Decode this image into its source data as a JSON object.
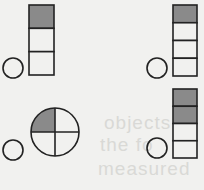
{
  "colors": {
    "background": "#f1f1ef",
    "stroke": "#222222",
    "shaded": "#8a8a8a",
    "unshaded": "#f1f1ef"
  },
  "bleed_through_text": [
    "objects",
    "the fo",
    "measured"
  ],
  "panels": [
    {
      "id": "top-left",
      "type": "bar",
      "parts": 3,
      "shaded": 1,
      "fraction": "1/3",
      "small_circle": {
        "cx": 13,
        "cy": 68,
        "r": 10
      },
      "shape": {
        "x": 29,
        "y": 5,
        "w": 25,
        "h": 70
      }
    },
    {
      "id": "top-right",
      "type": "bar",
      "parts": 4,
      "shaded": 1,
      "fraction": "1/4",
      "small_circle": {
        "cx": 157,
        "cy": 68,
        "r": 10
      },
      "shape": {
        "x": 173,
        "y": 5,
        "w": 24,
        "h": 71
      }
    },
    {
      "id": "bottom-left",
      "type": "circle",
      "parts": 4,
      "shaded": 1,
      "fraction": "1/4",
      "small_circle": {
        "cx": 13,
        "cy": 150,
        "r": 10
      },
      "shape": {
        "cx": 55,
        "cy": 132,
        "r": 24
      }
    },
    {
      "id": "bottom-right",
      "type": "bar",
      "parts": 4,
      "shaded": 2,
      "fraction": "2/4",
      "small_circle": {
        "cx": 157,
        "cy": 148,
        "r": 10
      },
      "shape": {
        "x": 173,
        "y": 89,
        "w": 24,
        "h": 69
      }
    }
  ]
}
